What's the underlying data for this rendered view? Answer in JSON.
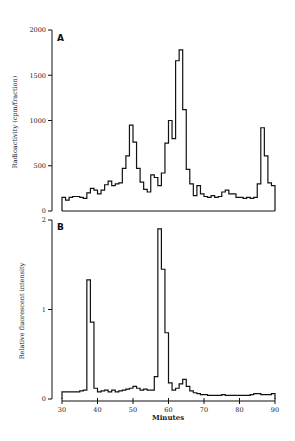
{
  "figure": {
    "width": 295,
    "height": 441,
    "line_color": "#111111"
  },
  "chart_data": [
    {
      "type": "line",
      "step": true,
      "panel": "A",
      "title": "",
      "panel_label": "A",
      "xlabel": "",
      "ylabel": "Radioactivity (cpm/fraction)",
      "xlim": [
        30,
        90
      ],
      "ylim": [
        0,
        2000
      ],
      "yticks": [
        0,
        500,
        1000,
        1500,
        2000
      ],
      "ytick_labels": [
        "0",
        "500",
        "1000",
        "1500",
        "2000"
      ],
      "grid": false,
      "x": [
        30,
        31,
        32,
        33,
        34,
        35,
        36,
        37,
        38,
        39,
        40,
        41,
        42,
        43,
        44,
        45,
        46,
        47,
        48,
        49,
        50,
        51,
        52,
        53,
        54,
        55,
        56,
        57,
        58,
        59,
        60,
        61,
        62,
        63,
        64,
        65,
        66,
        67,
        68,
        69,
        70,
        71,
        72,
        73,
        74,
        75,
        76,
        77,
        78,
        79,
        80,
        81,
        82,
        83,
        84,
        85,
        86,
        87,
        88,
        89
      ],
      "y": [
        150,
        120,
        150,
        160,
        160,
        150,
        140,
        200,
        250,
        230,
        190,
        230,
        290,
        330,
        280,
        300,
        310,
        470,
        610,
        950,
        760,
        470,
        320,
        240,
        210,
        400,
        370,
        280,
        420,
        750,
        1000,
        800,
        1660,
        1780,
        1120,
        460,
        300,
        170,
        280,
        190,
        160,
        150,
        170,
        150,
        160,
        210,
        230,
        190,
        190,
        150,
        150,
        140,
        150,
        140,
        150,
        300,
        920,
        610,
        310,
        280
      ],
      "pixel_map": {
        "x0": 62,
        "x1": 275,
        "y0": 211,
        "y1": 30
      }
    },
    {
      "type": "line",
      "step": true,
      "panel": "B",
      "title": "",
      "panel_label": "B",
      "xlabel": "Minutes",
      "ylabel": "Relative fluorescent intensity",
      "xlim": [
        30,
        90
      ],
      "ylim": [
        0,
        2
      ],
      "xticks": [
        30,
        40,
        50,
        60,
        70,
        80,
        90
      ],
      "xtick_labels": [
        "30",
        "40",
        "50",
        "60",
        "70",
        "80",
        "90"
      ],
      "yticks": [
        0,
        1,
        2
      ],
      "ytick_labels": [
        "0",
        "1",
        "2"
      ],
      "grid": false,
      "x": [
        30,
        31,
        32,
        33,
        34,
        35,
        36,
        37,
        38,
        39,
        40,
        41,
        42,
        43,
        44,
        45,
        46,
        47,
        48,
        49,
        50,
        51,
        52,
        53,
        54,
        55,
        56,
        57,
        58,
        59,
        60,
        61,
        62,
        63,
        64,
        65,
        66,
        67,
        68,
        69,
        70,
        71,
        72,
        73,
        74,
        75,
        76,
        77,
        78,
        79,
        80,
        81,
        82,
        83,
        84,
        85,
        86,
        87,
        88,
        89
      ],
      "y": [
        0.08,
        0.08,
        0.08,
        0.08,
        0.08,
        0.09,
        0.1,
        1.33,
        0.86,
        0.12,
        0.08,
        0.09,
        0.1,
        0.08,
        0.1,
        0.08,
        0.09,
        0.1,
        0.11,
        0.12,
        0.14,
        0.12,
        0.1,
        0.11,
        0.1,
        0.1,
        0.25,
        1.9,
        1.45,
        0.74,
        0.18,
        0.1,
        0.12,
        0.17,
        0.22,
        0.14,
        0.09,
        0.07,
        0.06,
        0.05,
        0.05,
        0.04,
        0.04,
        0.04,
        0.04,
        0.05,
        0.04,
        0.04,
        0.04,
        0.04,
        0.04,
        0.04,
        0.04,
        0.05,
        0.06,
        0.06,
        0.05,
        0.05,
        0.05,
        0.06
      ],
      "pixel_map": {
        "x0": 62,
        "x1": 275,
        "y0": 399,
        "y1": 220
      }
    }
  ]
}
